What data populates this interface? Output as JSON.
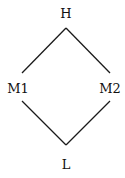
{
  "diagram": {
    "type": "lattice",
    "nodes": [
      {
        "id": "H",
        "label": "H",
        "x": 66,
        "y": 13
      },
      {
        "id": "M1",
        "label": "M1",
        "x": 18,
        "y": 88
      },
      {
        "id": "M2",
        "label": "M2",
        "x": 110,
        "y": 88
      },
      {
        "id": "L",
        "label": "L",
        "x": 66,
        "y": 164
      }
    ],
    "edges": [
      {
        "from": "H",
        "to": "M1"
      },
      {
        "from": "H",
        "to": "M2"
      },
      {
        "from": "M1",
        "to": "L"
      },
      {
        "from": "M2",
        "to": "L"
      }
    ],
    "colors": {
      "line": "#1a1a1a",
      "text": "#111111",
      "background": "#ffffff"
    }
  }
}
